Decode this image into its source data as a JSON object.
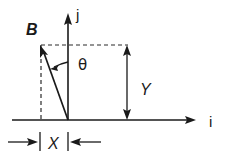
{
  "figure": {
    "background_color": "#ffffff",
    "ink_color": "#1a1a1a"
  },
  "labels": {
    "vector": "B",
    "angle": "θ",
    "axis_horizontal": "i",
    "axis_vertical": "j",
    "component_horizontal": "X",
    "component_vertical": "Y"
  },
  "geometry": {
    "origin": {
      "x": 68,
      "y": 120
    },
    "vector_tip": {
      "x": 41,
      "y": 46
    },
    "axis_horizontal": {
      "x1": 12,
      "y1": 120,
      "x2": 196,
      "y2": 120
    },
    "axis_vertical": {
      "x1": 68,
      "y1": 120,
      "x2": 68,
      "y2": 14
    },
    "dashed_top": {
      "x1": 41,
      "y1": 45,
      "x2": 128,
      "y2": 45
    },
    "dashed_left": {
      "x1": 41,
      "y1": 45,
      "x2": 41,
      "y2": 120
    },
    "y_dimension": {
      "x": 127,
      "y_top": 46,
      "y_bottom": 119
    },
    "x_dimension": {
      "y": 142,
      "left_start": 8,
      "left_tick": 40,
      "right_tick": 68,
      "right_end": 101
    },
    "angle_arc": {
      "cx": 68,
      "cy": 120,
      "radius": 58,
      "start_deg": 90,
      "end_deg": 110
    }
  },
  "label_positions": {
    "vector": {
      "x": 26,
      "y": 35
    },
    "angle": {
      "x": 78,
      "y": 70
    },
    "axis_horizontal": {
      "x": 209,
      "y": 127
    },
    "axis_vertical": {
      "x": 76,
      "y": 20
    },
    "component_horizontal": {
      "x": 48,
      "y": 149
    },
    "component_vertical": {
      "x": 140,
      "y": 95
    }
  }
}
